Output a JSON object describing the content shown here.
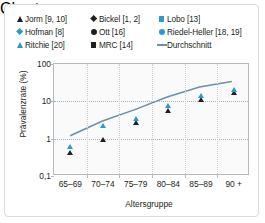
{
  "chart_data": {
    "type": "scatter",
    "title": "",
    "xlabel": "Altersgruppe",
    "ylabel": "Prävalenzrate (%)",
    "yscale": "log",
    "ylim": [
      0.1,
      100
    ],
    "ytick_labels": [
      "0,1",
      "1",
      "10",
      "100"
    ],
    "ytick_values": [
      0.1,
      1,
      10,
      100
    ],
    "grid": true,
    "legend_position": "top",
    "categories": [
      "65–69",
      "70–74",
      "75–79",
      "80–84",
      "85–89",
      "90 +"
    ],
    "series": [
      {
        "name": "Jorm [9, 10]",
        "marker": "triangle",
        "color": "#231f20",
        "values": [
          0.8,
          1.8,
          5.2,
          11.0,
          22.0,
          32.0
        ]
      },
      {
        "name": "Hofman [8]",
        "marker": "diamond",
        "color": "#2a9bd0",
        "values": [
          1.1,
          3.4,
          6.0,
          13.0,
          25.0,
          35.0
        ]
      },
      {
        "name": "Ritchie [20]",
        "marker": "triangle",
        "color": "#2a9bd0",
        "values": [
          1.2,
          4.3,
          6.6,
          14.5,
          27.0,
          40.0
        ]
      },
      {
        "name": "Bickel [1, 2]",
        "marker": "diamond",
        "color": "#231f20",
        "values": [
          0.7,
          1.7,
          5.0,
          10.5,
          21.0,
          30.0
        ]
      },
      {
        "name": "Ott [16]",
        "marker": "circle",
        "color": "#231f20",
        "values": [
          0.9,
          2.0,
          5.4,
          12.0,
          23.0,
          33.0
        ]
      },
      {
        "name": "MRC [14]",
        "marker": "square",
        "color": "#231f20",
        "values": [
          1.4,
          2.3,
          5.6,
          15.0,
          26.0,
          36.0
        ]
      },
      {
        "name": "Lobo [13]",
        "marker": "square",
        "color": "#2a9bd0",
        "values": [
          1.3,
          3.0,
          5.8,
          12.5,
          20.0,
          29.0
        ]
      },
      {
        "name": "Riedel-Heller [18, 19]",
        "marker": "circle",
        "color": "#2a9bd0",
        "values": [
          1.0,
          3.8,
          6.3,
          13.5,
          24.0,
          38.0
        ]
      },
      {
        "name": "Durchschnitt",
        "marker": "line",
        "color": "#6d90a6",
        "values": [
          1.1,
          2.8,
          5.7,
          12.5,
          23.5,
          33.5
        ]
      }
    ]
  },
  "legend": {
    "columns": [
      [
        {
          "label": "Jorm [9, 10]",
          "marker": "triangle-dark"
        },
        {
          "label": "Hofman [8]",
          "marker": "diamond-blue"
        },
        {
          "label": "Ritchie [20]",
          "marker": "triangle-blue"
        }
      ],
      [
        {
          "label": "Bickel [1, 2]",
          "marker": "diamond-dark"
        },
        {
          "label": "Ott [16]",
          "marker": "circle-dark"
        },
        {
          "label": "MRC [14]",
          "marker": "square-dark"
        }
      ],
      [
        {
          "label": "Lobo [13]",
          "marker": "square-blue"
        },
        {
          "label": "Riedel-Heller [18, 19]",
          "marker": "circle-blue"
        },
        {
          "label": "Durchschnitt",
          "marker": "line-blue"
        }
      ]
    ]
  },
  "colors": {
    "accent_blue": "#2a9bd0",
    "dark": "#231f20",
    "trend_line": "#6d90a6",
    "grid": "#9fb4c4",
    "frame": "#b8b8b8",
    "border": "#d9d9d9",
    "plot_bg": "#fafafa"
  }
}
